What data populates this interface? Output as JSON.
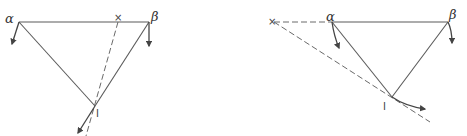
{
  "diagrams": [
    {
      "name": "left",
      "labels": {
        "alpha": "α",
        "beta": "β",
        "x": "×",
        "i": "I"
      }
    },
    {
      "name": "right",
      "labels": {
        "alpha": "α",
        "beta": "β",
        "x": "×",
        "i": "I"
      }
    }
  ],
  "colors": {
    "stroke": "#5a5a5a",
    "text": "#333333"
  }
}
